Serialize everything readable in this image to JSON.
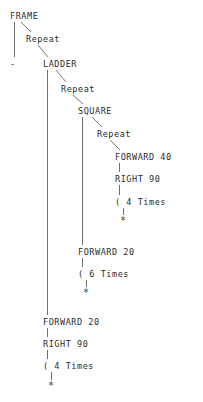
{
  "diagram": {
    "type": "tree",
    "text_color": "#2b2b2b",
    "edge_color": "#6e6e6e",
    "background": "#ffffff",
    "nodes": [
      {
        "id": "frame",
        "label": "FRAME",
        "x": 10,
        "y": 12
      },
      {
        "id": "repeat1",
        "label": "Repeat",
        "x": 26,
        "y": 35
      },
      {
        "id": "dash",
        "label": "-",
        "x": 10,
        "y": 60
      },
      {
        "id": "ladder",
        "label": "LADDER",
        "x": 43,
        "y": 60
      },
      {
        "id": "repeat2",
        "label": "Repeat",
        "x": 61,
        "y": 85
      },
      {
        "id": "square",
        "label": "SQUARE",
        "x": 78,
        "y": 107
      },
      {
        "id": "repeat3",
        "label": "Repeat",
        "x": 97,
        "y": 130
      },
      {
        "id": "forward40",
        "label": "FORWARD 40",
        "x": 115,
        "y": 153
      },
      {
        "id": "right90a",
        "label": "RIGHT 90",
        "x": 115,
        "y": 175
      },
      {
        "id": "times4a",
        "label": "( 4 Times",
        "x": 115,
        "y": 198
      },
      {
        "id": "star1",
        "label": "*",
        "x": 120,
        "y": 216
      },
      {
        "id": "forward20a",
        "label": "FORWARD 20",
        "x": 78,
        "y": 248
      },
      {
        "id": "times6",
        "label": "( 6 Times",
        "x": 78,
        "y": 270
      },
      {
        "id": "star2",
        "label": "*",
        "x": 83,
        "y": 288
      },
      {
        "id": "forward20b",
        "label": "FORWARD 20",
        "x": 43,
        "y": 318
      },
      {
        "id": "right90b",
        "label": "RIGHT 90",
        "x": 43,
        "y": 340
      },
      {
        "id": "times4b",
        "label": "( 4 Times",
        "x": 43,
        "y": 362
      },
      {
        "id": "star3",
        "label": "*",
        "x": 48,
        "y": 381
      }
    ],
    "edges": [
      {
        "from": "frame",
        "to": "dash",
        "kind": "vertical",
        "x1": 14,
        "y1": 22,
        "x2": 14,
        "y2": 57
      },
      {
        "from": "frame",
        "to": "repeat1",
        "kind": "diagonal",
        "x1": 21,
        "y1": 22,
        "x2": 31,
        "y2": 32
      },
      {
        "from": "repeat1",
        "to": "ladder",
        "kind": "diagonal",
        "x1": 38,
        "y1": 45,
        "x2": 48,
        "y2": 57
      },
      {
        "from": "ladder",
        "to": "forward20b",
        "kind": "vertical",
        "x1": 47,
        "y1": 70,
        "x2": 47,
        "y2": 315
      },
      {
        "from": "ladder",
        "to": "repeat2",
        "kind": "diagonal",
        "x1": 56,
        "y1": 70,
        "x2": 66,
        "y2": 82
      },
      {
        "from": "repeat2",
        "to": "square",
        "kind": "diagonal",
        "x1": 73,
        "y1": 95,
        "x2": 83,
        "y2": 104
      },
      {
        "from": "square",
        "to": "forward20a",
        "kind": "vertical",
        "x1": 82,
        "y1": 117,
        "x2": 82,
        "y2": 245
      },
      {
        "from": "square",
        "to": "repeat3",
        "kind": "diagonal",
        "x1": 92,
        "y1": 117,
        "x2": 102,
        "y2": 127
      },
      {
        "from": "repeat3",
        "to": "forward40",
        "kind": "diagonal",
        "x1": 110,
        "y1": 140,
        "x2": 120,
        "y2": 150
      },
      {
        "from": "forward40",
        "to": "right90a",
        "kind": "vertical",
        "x1": 119,
        "y1": 163,
        "x2": 119,
        "y2": 172
      },
      {
        "from": "right90a",
        "to": "times4a",
        "kind": "vertical",
        "x1": 119,
        "y1": 185,
        "x2": 119,
        "y2": 195
      },
      {
        "from": "times4a",
        "to": "star1",
        "kind": "vertical",
        "x1": 123,
        "y1": 208,
        "x2": 123,
        "y2": 215
      },
      {
        "from": "forward20a",
        "to": "times6",
        "kind": "vertical",
        "x1": 82,
        "y1": 258,
        "x2": 82,
        "y2": 267
      },
      {
        "from": "times6",
        "to": "star2",
        "kind": "vertical",
        "x1": 86,
        "y1": 280,
        "x2": 86,
        "y2": 287
      },
      {
        "from": "forward20b",
        "to": "right90b",
        "kind": "vertical",
        "x1": 47,
        "y1": 328,
        "x2": 47,
        "y2": 337
      },
      {
        "from": "right90b",
        "to": "times4b",
        "kind": "vertical",
        "x1": 47,
        "y1": 350,
        "x2": 47,
        "y2": 359
      },
      {
        "from": "times4b",
        "to": "star3",
        "kind": "vertical",
        "x1": 51,
        "y1": 372,
        "x2": 51,
        "y2": 380
      }
    ]
  }
}
